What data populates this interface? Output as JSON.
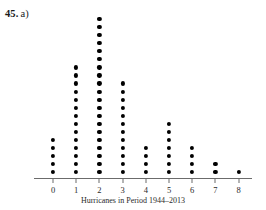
{
  "exercise": {
    "number": "45.",
    "part": "a)"
  },
  "chart_data": {
    "type": "dotplot",
    "title": "",
    "subtitle": "",
    "xlabel": "Hurricanes in Period 1944–2013",
    "ylabel": "",
    "categories": [
      "0",
      "1",
      "2",
      "3",
      "4",
      "5",
      "6",
      "7",
      "8"
    ],
    "values": [
      5,
      14,
      20,
      12,
      4,
      7,
      4,
      2,
      1
    ],
    "tick_labels": [
      "0",
      "1",
      "2",
      "3",
      "4",
      "5",
      "6",
      "7",
      "8"
    ],
    "xlim": [
      -0.6,
      8.6
    ],
    "ylim": [
      0,
      21
    ],
    "grid": false,
    "legend": "none",
    "dot_color": "#000000",
    "axis_color": "#6b6b6b"
  },
  "geometry": {
    "axis_y": 178,
    "axis_left": 34,
    "axis_right": 252,
    "first_tick_x": 53,
    "tick_spacing": 23.2,
    "dot_spacing": 8.05,
    "first_dot_offset": 6
  }
}
